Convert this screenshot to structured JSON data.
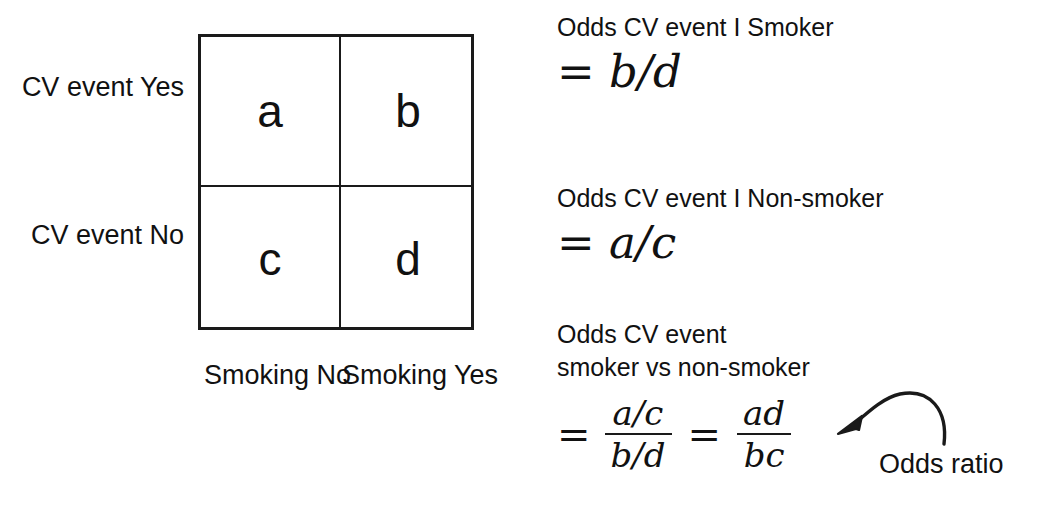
{
  "table": {
    "cells": [
      {
        "id": "a",
        "value": "a"
      },
      {
        "id": "b",
        "value": "b"
      },
      {
        "id": "c",
        "value": "c"
      },
      {
        "id": "d",
        "value": "d"
      }
    ],
    "row_labels": [
      {
        "id": "cv-yes",
        "text": "CV event\nYes"
      },
      {
        "id": "cv-no",
        "text": "CV event\nNo"
      }
    ],
    "column_labels": [
      {
        "id": "smoking-no",
        "text": "Smoking\nNo"
      },
      {
        "id": "smoking-yes",
        "text": "Smoking\nYes"
      }
    ]
  },
  "formulas": [
    {
      "caption": "Odds CV event I Smoker",
      "equation": "= b/d"
    },
    {
      "caption": "Odds CV event I Non-smoker",
      "equation": "= a/c"
    },
    {
      "caption": "Odds CV event\nsmoker vs non-smoker",
      "eq_sign_1": "=",
      "fraction_1": {
        "numerator": "a/c",
        "denominator": "b/d"
      },
      "eq_sign_2": "=",
      "fraction_2": {
        "numerator": "ad",
        "denominator": "bc"
      }
    }
  ],
  "annotation": {
    "label": "Odds ratio",
    "arrow": "curved-arrow-pointing-left"
  },
  "colors": {
    "ink": "#111111",
    "rule": "#1a1a1a",
    "background": "#ffffff"
  }
}
